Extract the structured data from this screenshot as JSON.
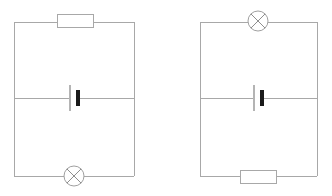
{
  "page": {
    "title": "Two electric circuit diagrams",
    "background_color": "#ffffff",
    "width": 332,
    "height": 196
  },
  "style": {
    "wire_color": "#a8a8a8",
    "component_outline_color": "#a8a8a8",
    "component_fill_color": "#ffffff",
    "lamp_stroke_color": "#8e8e8e",
    "cell_long_plate_color": "#b4b4b4",
    "cell_short_plate_color": "#1a1a1a"
  },
  "circuits": [
    {
      "id": "circuit-left",
      "name": "left-circuit",
      "label": "Circuit 1",
      "loop": {
        "x": 14,
        "y": 22,
        "width": 120,
        "height": 154
      },
      "middle_branch_y": 98,
      "components": [
        {
          "id": "left-resistor",
          "type": "resistor",
          "symbol": "rectangle",
          "label": "Resistor",
          "position": "top",
          "center_x": 75,
          "center_y": 21,
          "body_width": 36,
          "body_height": 13
        },
        {
          "id": "left-cell",
          "type": "cell",
          "symbol": "battery-cell",
          "label": "Cell",
          "position": "middle",
          "center_x": 74,
          "center_y": 98,
          "long_plate_x": 70,
          "long_plate_half_height": 13,
          "short_plate_x": 78,
          "short_plate_half_height": 8
        },
        {
          "id": "left-lamp",
          "type": "lamp",
          "symbol": "circle-with-cross",
          "label": "Lamp",
          "position": "bottom",
          "center_x": 74,
          "center_y": 176,
          "radius": 10
        }
      ]
    },
    {
      "id": "circuit-right",
      "name": "right-circuit",
      "label": "Circuit 2",
      "loop": {
        "x": 200,
        "y": 22,
        "width": 117,
        "height": 154
      },
      "middle_branch_y": 98,
      "components": [
        {
          "id": "right-lamp",
          "type": "lamp",
          "symbol": "circle-with-cross",
          "label": "Lamp",
          "position": "top",
          "center_x": 258,
          "center_y": 21,
          "radius": 10
        },
        {
          "id": "right-cell",
          "type": "cell",
          "symbol": "battery-cell",
          "label": "Cell",
          "position": "middle",
          "center_x": 258,
          "center_y": 98,
          "long_plate_x": 254,
          "long_plate_half_height": 13,
          "short_plate_x": 262,
          "short_plate_half_height": 8
        },
        {
          "id": "right-resistor",
          "type": "resistor",
          "symbol": "rectangle",
          "label": "Resistor",
          "position": "bottom",
          "center_x": 258,
          "center_y": 177,
          "body_width": 36,
          "body_height": 13
        }
      ]
    }
  ]
}
